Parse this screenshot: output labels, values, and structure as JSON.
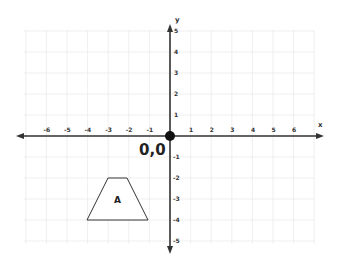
{
  "diagram": {
    "type": "coordinate-plane",
    "origin_label": "0,0",
    "x_axis": {
      "name": "x",
      "ticks": [
        "-6",
        "-5",
        "-4",
        "-3",
        "-2",
        "-1",
        "1",
        "2",
        "3",
        "4",
        "5",
        "6"
      ],
      "tick_values": [
        -6,
        -5,
        -4,
        -3,
        -2,
        -1,
        1,
        2,
        3,
        4,
        5,
        6
      ]
    },
    "y_axis": {
      "name": "y",
      "ticks": [
        "5",
        "4",
        "3",
        "2",
        "1",
        "-1",
        "-2",
        "-3",
        "-4",
        "-5"
      ],
      "tick_values": [
        5,
        4,
        3,
        2,
        1,
        -1,
        -2,
        -3,
        -4,
        -5
      ]
    },
    "shapes": [
      {
        "label": "A",
        "kind": "trapezoid",
        "vertices": [
          [
            -3,
            -2
          ],
          [
            -2,
            -2
          ],
          [
            -4,
            -4
          ],
          [
            -1,
            -4
          ]
        ]
      }
    ],
    "colors": {
      "axis": "#333333",
      "grid": "#e8e8e8",
      "origin_dot": "#111111",
      "shape_stroke": "#333333"
    }
  }
}
